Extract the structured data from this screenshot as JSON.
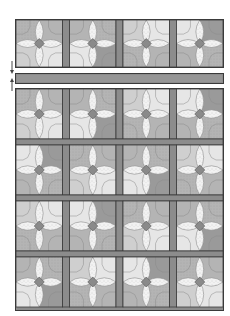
{
  "diagram": {
    "title": "",
    "colors": {
      "background": "#ffffff",
      "outline": "#3a3a3a",
      "sashing": "#8c8c8c",
      "dark": "#9a9a9a",
      "medium": "#b4b4b4",
      "light": "#cfcfcf",
      "pale": "#e6e6e6",
      "speckle": "#f2f2f2",
      "center": "#8a8a8a"
    },
    "top_row": {
      "label": "block-row",
      "blocks": 4
    },
    "strip": {
      "label": "horizontal-sashing-strip"
    },
    "assembly_arrows": {
      "label": "join-arrows",
      "count": 2
    },
    "quilt": {
      "rows": 4,
      "columns": 4
    }
  }
}
